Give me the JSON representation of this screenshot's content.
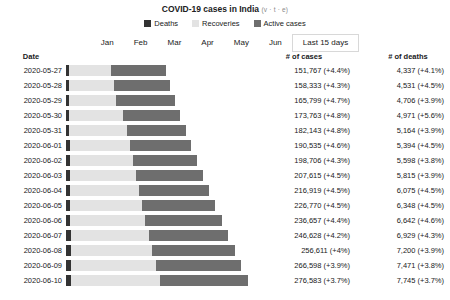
{
  "header": {
    "title": "COVID-19 cases in India",
    "vte": "(v · t · e)"
  },
  "legend": {
    "items": [
      {
        "label": "Deaths",
        "color": "#333333"
      },
      {
        "label": "Recoveries",
        "color": "#e3e3e3"
      },
      {
        "label": "Active cases",
        "color": "#6e6e6e"
      }
    ]
  },
  "tabs": {
    "items": [
      {
        "label": "Jan",
        "selected": false
      },
      {
        "label": "Feb",
        "selected": false
      },
      {
        "label": "Mar",
        "selected": false
      },
      {
        "label": "Apr",
        "selected": false
      },
      {
        "label": "May",
        "selected": false
      },
      {
        "label": "Jun",
        "selected": false
      },
      {
        "label": "Last 15 days",
        "selected": true
      }
    ]
  },
  "table": {
    "columns": [
      "Date",
      "# of cases",
      "# of deaths"
    ],
    "rows": [
      {
        "date": "2020-05-27",
        "cases": "151,767 (+4.4%)",
        "deaths": "4,337 (+4.1%)"
      },
      {
        "date": "2020-05-28",
        "cases": "158,333 (+4.3%)",
        "deaths": "4,531 (+4.5%)"
      },
      {
        "date": "2020-05-29",
        "cases": "165,799 (+4.7%)",
        "deaths": "4,706 (+3.9%)"
      },
      {
        "date": "2020-05-30",
        "cases": "173,763 (+4.8%)",
        "deaths": "4,971 (+5.6%)"
      },
      {
        "date": "2020-05-31",
        "cases": "182,143 (+4.8%)",
        "deaths": "5,164 (+3.9%)"
      },
      {
        "date": "2020-06-01",
        "cases": "190,535 (+4.6%)",
        "deaths": "5,394 (+4.5%)"
      },
      {
        "date": "2020-06-02",
        "cases": "198,706 (+4.3%)",
        "deaths": "5,598 (+3.8%)"
      },
      {
        "date": "2020-06-03",
        "cases": "207,615 (+4.5%)",
        "deaths": "5,815 (+3.9%)"
      },
      {
        "date": "2020-06-04",
        "cases": "216,919 (+4.5%)",
        "deaths": "6,075 (+4.5%)"
      },
      {
        "date": "2020-06-05",
        "cases": "226,770 (+4.5%)",
        "deaths": "6,348 (+4.5%)"
      },
      {
        "date": "2020-06-06",
        "cases": "236,657 (+4.4%)",
        "deaths": "6,642 (+4.6%)"
      },
      {
        "date": "2020-06-07",
        "cases": "246,628 (+4.2%)",
        "deaths": "6,929 (+4.3%)"
      },
      {
        "date": "2020-06-08",
        "cases": "256,611 (+4%)",
        "deaths": "7,200 (+3.9%)"
      },
      {
        "date": "2020-06-09",
        "cases": "266,598 (+3.9%)",
        "deaths": "7,471 (+3.8%)"
      },
      {
        "date": "2020-06-10",
        "cases": "276,583 (+3.7%)",
        "deaths": "7,745 (+3.7%)"
      }
    ]
  },
  "chart_data": {
    "type": "bar",
    "title": "COVID-19 cases in India",
    "orientation": "horizontal",
    "stacked": true,
    "xlabel": "",
    "ylabel": "Date",
    "grid": false,
    "legend_position": "top",
    "xlim": [
      0,
      285000
    ],
    "bar_px_per_case": 0.000658,
    "bar_origin_px": 66,
    "categories": [
      "2020-05-27",
      "2020-05-28",
      "2020-05-29",
      "2020-05-30",
      "2020-05-31",
      "2020-06-01",
      "2020-06-02",
      "2020-06-03",
      "2020-06-04",
      "2020-06-05",
      "2020-06-06",
      "2020-06-07",
      "2020-06-08",
      "2020-06-09",
      "2020-06-10"
    ],
    "series": [
      {
        "name": "Deaths",
        "color": "#333333",
        "values": [
          4337,
          4531,
          4706,
          4971,
          5164,
          5394,
          5598,
          5815,
          6075,
          6348,
          6642,
          6929,
          7200,
          7471,
          7745
        ]
      },
      {
        "name": "Recoveries",
        "color": "#e3e3e3",
        "values": [
          64426,
          67692,
          71106,
          82370,
          86984,
          91852,
          95754,
          100303,
          104107,
          109462,
          114073,
          118695,
          124095,
          129215,
          135206
        ]
      },
      {
        "name": "Active cases",
        "color": "#6e6e6e",
        "values": [
          83004,
          86110,
          89987,
          86422,
          89995,
          93289,
          97354,
          101497,
          106737,
          110960,
          115942,
          121004,
          125316,
          129912,
          133632
        ]
      }
    ],
    "totals": [
      151767,
      158333,
      165799,
      173763,
      182143,
      190535,
      198706,
      207615,
      216919,
      226770,
      236657,
      246628,
      256611,
      266598,
      276583
    ],
    "total_growth_pct": [
      4.4,
      4.3,
      4.7,
      4.8,
      4.8,
      4.6,
      4.3,
      4.5,
      4.5,
      4.5,
      4.4,
      4.2,
      4.0,
      3.9,
      3.7
    ],
    "deaths_growth_pct": [
      4.1,
      4.5,
      3.9,
      5.6,
      3.9,
      4.5,
      3.8,
      3.9,
      4.5,
      4.5,
      4.6,
      4.3,
      3.9,
      3.8,
      3.7
    ]
  }
}
